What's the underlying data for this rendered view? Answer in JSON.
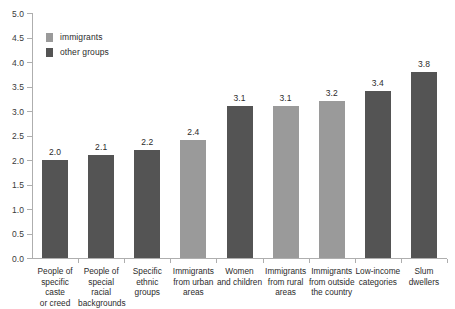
{
  "chart_data": {
    "type": "bar",
    "title": "",
    "subtitle": "",
    "xlabel": "",
    "ylabel": "",
    "ylim": [
      0.0,
      5.0
    ],
    "ytick_step": 0.5,
    "grid": false,
    "legend_position": "upper-left",
    "categories": [
      "People of specific caste or creed",
      "People of special racial backgrounds",
      "Specific ethnic groups",
      "Immigrants from urban areas",
      "Women and children",
      "Immigrants from rural areas",
      "Immigrants from outside the country",
      "Low-income categories",
      "Slum dwellers"
    ],
    "category_lines": [
      [
        "People of",
        "specific caste",
        "or creed"
      ],
      [
        "People of",
        "special",
        "racial",
        "backgrounds"
      ],
      [
        "Specific",
        "ethnic",
        "groups"
      ],
      [
        "Immigrants",
        "from urban",
        "areas"
      ],
      [
        "Women",
        "and children"
      ],
      [
        "Immigrants",
        "from rural",
        "areas"
      ],
      [
        "Immigrants",
        "from outside",
        "the country"
      ],
      [
        "Low-income",
        "categories"
      ],
      [
        "Slum",
        "dwellers"
      ]
    ],
    "values": [
      2.0,
      2.1,
      2.2,
      2.4,
      3.1,
      3.1,
      3.2,
      3.4,
      3.8
    ],
    "value_labels": [
      "2.0",
      "2.1",
      "2.2",
      "2.4",
      "3.1",
      "3.1",
      "3.2",
      "3.4",
      "3.8"
    ],
    "groups": [
      "other groups",
      "other groups",
      "other groups",
      "immigrants",
      "other groups",
      "immigrants",
      "immigrants",
      "other groups",
      "other groups"
    ],
    "ytick_labels": [
      "0.0",
      "0.5",
      "1.0",
      "1.5",
      "2.0",
      "2.5",
      "3.0",
      "3.5",
      "4.0",
      "4.5",
      "5.0"
    ],
    "ytick_values": [
      0.0,
      0.5,
      1.0,
      1.5,
      2.0,
      2.5,
      3.0,
      3.5,
      4.0,
      4.5,
      5.0
    ],
    "series": [
      {
        "name": "immigrants",
        "color": "#9a9a9a"
      },
      {
        "name": "other groups",
        "color": "#545454"
      }
    ]
  },
  "legend": {
    "items": [
      {
        "label": "immigrants",
        "color": "#9a9a9a"
      },
      {
        "label": "other groups",
        "color": "#545454"
      }
    ]
  },
  "colors": {
    "immigrants": "#9a9a9a",
    "other_groups": "#545454",
    "axis": "#aeaeae",
    "text": "#2b2b2b",
    "background": "#ffffff"
  }
}
